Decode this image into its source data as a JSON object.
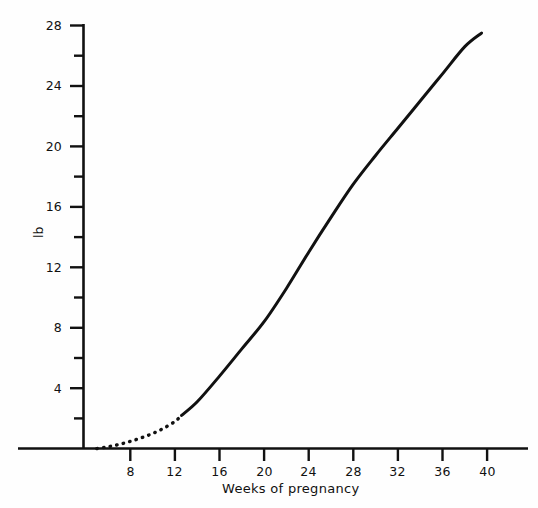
{
  "chart_data": {
    "type": "line",
    "title": "",
    "subtitle": "",
    "xlabel": "Weeks of pregnancy",
    "ylabel": "lb",
    "xlim": [
      3.8,
      43.7
    ],
    "ylim": [
      0,
      28.5
    ],
    "grid": false,
    "legend": null,
    "x_ticks": [
      8,
      12,
      16,
      20,
      24,
      28,
      32,
      36,
      40
    ],
    "x_tick_labels": [
      "8",
      "12",
      "16",
      "20",
      "24",
      "28",
      "32",
      "36",
      "40"
    ],
    "x_minor_ticks": [],
    "y_ticks": [
      4,
      8,
      12,
      16,
      20,
      24,
      28
    ],
    "y_tick_labels": [
      "4",
      "8",
      "12",
      "16",
      "20",
      "24",
      "28"
    ],
    "y_minor_ticks": [
      2,
      6,
      10,
      14,
      18,
      22,
      26
    ],
    "series": [
      {
        "name": "cumulative weight gain (extrapolated)",
        "style": "dotted",
        "x": [
          5.0,
          6.0,
          7.0,
          8.0,
          9.0,
          10.0,
          11.0,
          12.0,
          12.6
        ],
        "values": [
          0.0,
          0.12,
          0.28,
          0.48,
          0.72,
          1.0,
          1.35,
          1.8,
          2.2
        ]
      },
      {
        "name": "cumulative weight gain (observed)",
        "style": "solid",
        "x": [
          12.6,
          14.0,
          16.0,
          18.0,
          20.0,
          22.0,
          24.0,
          26.0,
          28.0,
          30.0,
          32.0,
          34.0,
          36.0,
          38.0,
          39.5
        ],
        "values": [
          2.2,
          3.1,
          4.8,
          6.6,
          8.4,
          10.6,
          13.0,
          15.3,
          17.5,
          19.4,
          21.2,
          23.0,
          24.8,
          26.6,
          27.5
        ]
      }
    ],
    "annotations": []
  },
  "axis": {
    "y_label_text": "lb",
    "x_label_text": "Weeks of pregnancy"
  }
}
